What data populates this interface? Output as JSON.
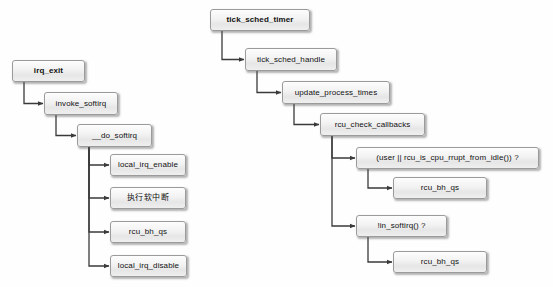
{
  "diagram": {
    "type": "flowchart",
    "canvas": {
      "width": 553,
      "height": 287,
      "background": "#fefefe"
    },
    "style": {
      "node_border": "#9b9b9b",
      "node_fill_top": "#fdfdfd",
      "node_fill_bottom": "#e6e6e6",
      "edge_color": "#3a3a3a",
      "text_color": "#111111"
    },
    "nodes": [
      {
        "id": "irq_exit",
        "label": "irq_exit",
        "x": 12,
        "y": 60,
        "w": 73,
        "h": 22,
        "bold": true,
        "cjk": false
      },
      {
        "id": "invoke_softirq",
        "label": "invoke_softirq",
        "x": 44,
        "y": 92,
        "w": 74,
        "h": 23,
        "bold": false,
        "cjk": false
      },
      {
        "id": "__do_softirq",
        "label": "__do_softirq",
        "x": 77,
        "y": 124,
        "w": 75,
        "h": 23,
        "bold": false,
        "cjk": false
      },
      {
        "id": "local_irq_enable",
        "label": "local_irq_enable",
        "x": 110,
        "y": 154,
        "w": 76,
        "h": 22,
        "bold": false,
        "cjk": false
      },
      {
        "id": "exec_softirq_cn",
        "label": "执行软中断",
        "x": 110,
        "y": 187,
        "w": 76,
        "h": 22,
        "bold": false,
        "cjk": true
      },
      {
        "id": "rcu_bh_qs_left",
        "label": "rcu_bh_qs",
        "x": 110,
        "y": 221,
        "w": 76,
        "h": 22,
        "bold": false,
        "cjk": false
      },
      {
        "id": "local_irq_disable",
        "label": "local_irq_disable",
        "x": 110,
        "y": 255,
        "w": 77,
        "h": 22,
        "bold": false,
        "cjk": false
      },
      {
        "id": "tick_sched_timer",
        "label": "tick_sched_timer",
        "x": 210,
        "y": 9,
        "w": 100,
        "h": 22,
        "bold": true,
        "cjk": false
      },
      {
        "id": "tick_sched_handle",
        "label": "tick_sched_handle",
        "x": 245,
        "y": 48,
        "w": 92,
        "h": 23,
        "bold": false,
        "cjk": false
      },
      {
        "id": "update_process_times",
        "label": "update_process_times",
        "x": 282,
        "y": 81,
        "w": 108,
        "h": 23,
        "bold": false,
        "cjk": false
      },
      {
        "id": "rcu_check_callbacks",
        "label": "rcu_check_callbacks",
        "x": 320,
        "y": 113,
        "w": 105,
        "h": 23,
        "bold": false,
        "cjk": false
      },
      {
        "id": "user_or_rrupt",
        "label": "(user || rcu_is_cpu_rrupt_from_idle()) ?",
        "x": 356,
        "y": 147,
        "w": 183,
        "h": 22,
        "bold": false,
        "cjk": false
      },
      {
        "id": "rcu_bh_qs_r1",
        "label": "rcu_bh_qs",
        "x": 393,
        "y": 177,
        "w": 94,
        "h": 22,
        "bold": false,
        "cjk": false
      },
      {
        "id": "not_in_softirq",
        "label": "!in_softirq() ?",
        "x": 356,
        "y": 215,
        "w": 91,
        "h": 22,
        "bold": false,
        "cjk": false
      },
      {
        "id": "rcu_bh_qs_r2",
        "label": "rcu_bh_qs",
        "x": 393,
        "y": 251,
        "w": 94,
        "h": 22,
        "bold": false,
        "cjk": false
      }
    ],
    "edges": [
      {
        "from": "irq_exit",
        "to": "invoke_softirq",
        "kind": "elbow"
      },
      {
        "from": "invoke_softirq",
        "to": "__do_softirq",
        "kind": "elbow"
      },
      {
        "from": "__do_softirq",
        "to": "local_irq_enable",
        "kind": "elbow"
      },
      {
        "from": "__do_softirq",
        "to": "exec_softirq_cn",
        "kind": "elbow"
      },
      {
        "from": "__do_softirq",
        "to": "rcu_bh_qs_left",
        "kind": "elbow"
      },
      {
        "from": "__do_softirq",
        "to": "local_irq_disable",
        "kind": "elbow"
      },
      {
        "from": "tick_sched_timer",
        "to": "tick_sched_handle",
        "kind": "elbow"
      },
      {
        "from": "tick_sched_handle",
        "to": "update_process_times",
        "kind": "elbow"
      },
      {
        "from": "update_process_times",
        "to": "rcu_check_callbacks",
        "kind": "elbow"
      },
      {
        "from": "rcu_check_callbacks",
        "to": "user_or_rrupt",
        "kind": "elbow"
      },
      {
        "from": "rcu_check_callbacks",
        "to": "not_in_softirq",
        "kind": "elbow"
      },
      {
        "from": "user_or_rrupt",
        "to": "rcu_bh_qs_r1",
        "kind": "elbow"
      },
      {
        "from": "not_in_softirq",
        "to": "rcu_bh_qs_r2",
        "kind": "elbow"
      }
    ]
  }
}
